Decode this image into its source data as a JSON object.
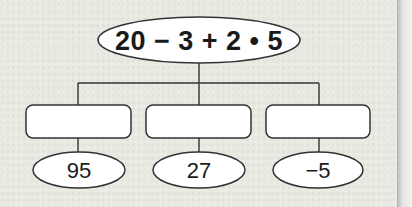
{
  "diagram": {
    "root": {
      "expression": "20 − 3 + 2 • 5"
    },
    "branches": [
      {
        "step_box": "",
        "result": "95"
      },
      {
        "step_box": "",
        "result": "27"
      },
      {
        "step_box": "",
        "result": "−5"
      }
    ]
  },
  "colors": {
    "background": "#ebeae3",
    "stroke": "#333333",
    "fill": "#ffffff"
  }
}
